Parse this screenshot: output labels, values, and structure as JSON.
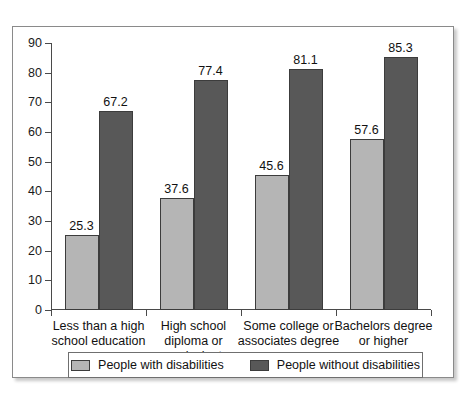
{
  "chart_data": {
    "type": "bar",
    "title": "",
    "subtitle": "",
    "xlabel": "",
    "ylabel": "",
    "ylim": [
      0,
      90
    ],
    "yticks": [
      0,
      10,
      20,
      30,
      40,
      50,
      60,
      70,
      80,
      90
    ],
    "grid": false,
    "legend_position": "bottom",
    "categories": [
      "Less than a high school education",
      "High school diploma or equivalent",
      "Some college or associates degree",
      "Bachelors degree or higher"
    ],
    "category_lines": [
      [
        "Less than a high",
        "school education"
      ],
      [
        "High school",
        "diploma or",
        "equivalent"
      ],
      [
        "Some college or",
        "associates degree"
      ],
      [
        "Bachelors degree",
        "or higher"
      ]
    ],
    "series": [
      {
        "name": "People with disabilities",
        "color": "#b5b5b5",
        "values": [
          25.3,
          37.6,
          45.6,
          57.6
        ],
        "labels": [
          "25.3",
          "37.6",
          "45.6",
          "57.6"
        ]
      },
      {
        "name": "People without disabilities",
        "color": "#585858",
        "values": [
          67.2,
          77.4,
          81.1,
          85.3
        ],
        "labels": [
          "67.2",
          "77.4",
          "81.1",
          "85.3"
        ]
      }
    ]
  },
  "axis": {
    "y_tick_labels": [
      "90",
      "80",
      "70",
      "60",
      "50",
      "40",
      "30",
      "20",
      "10",
      "0"
    ]
  },
  "legend": {
    "items": [
      {
        "label": "People with disabilities",
        "color": "#b5b5b5"
      },
      {
        "label": "People without disabilities",
        "color": "#585858"
      }
    ]
  },
  "colors": {
    "series_light": "#b5b5b5",
    "series_dark": "#585858",
    "axis": "#4a4a4a",
    "frame": "#8a8a8a",
    "text": "#111111",
    "background": "#ffffff"
  }
}
